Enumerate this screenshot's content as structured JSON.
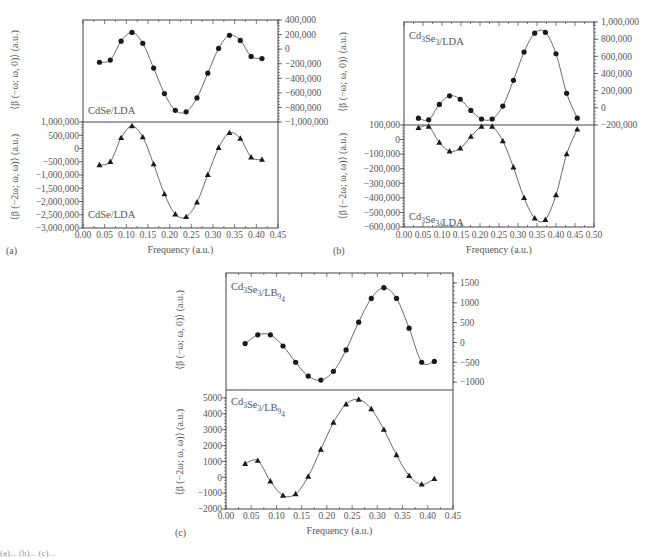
{
  "figure": {
    "caption_fragment": "(a)... (b)... (c)..."
  },
  "chart_data": [
    {
      "panel": "a",
      "subplot": "top",
      "type": "line",
      "label": "CdSe/LDA",
      "ylabel": "⟨β (−ω; ω, 0)⟩ (a.u.)",
      "xlabel": "",
      "y_axis_side": "right",
      "ylim": [
        -1000000,
        400000
      ],
      "yticks": [
        400000,
        200000,
        0,
        -200000,
        -400000,
        -600000,
        -800000,
        -1000000
      ],
      "ytick_labels": [
        "400,000",
        "200,000",
        "0",
        "−200,000",
        "−400,000",
        "−600,000",
        "−800,000",
        "−1,000,000"
      ],
      "xlim": [
        0.0,
        0.45
      ],
      "marker": "circle",
      "x": [
        0.038,
        0.063,
        0.088,
        0.113,
        0.138,
        0.163,
        0.188,
        0.213,
        0.238,
        0.263,
        0.288,
        0.313,
        0.338,
        0.363,
        0.388,
        0.413
      ],
      "values": [
        -180000,
        -150000,
        110000,
        230000,
        80000,
        -260000,
        -610000,
        -840000,
        -860000,
        -670000,
        -330000,
        10000,
        190000,
        120000,
        -100000,
        -130000
      ]
    },
    {
      "panel": "a",
      "subplot": "bottom",
      "type": "line",
      "label": "CdSe/LDA",
      "ylabel": "⟨β (−2ω; ω, ω)⟩ (a.u.)",
      "xlabel": "Frequency (a.u.)",
      "y_axis_side": "left",
      "ylim": [
        -3000000,
        1000000
      ],
      "yticks": [
        1000000,
        500000,
        0,
        -500000,
        -1000000,
        -1500000,
        -2000000,
        -2500000,
        -3000000
      ],
      "ytick_labels": [
        "1,000,000",
        "500,000",
        "0",
        "−500,000",
        "−1,000,000",
        "−1,500,000",
        "−2,000,000",
        "−2,500,000",
        "−3,000,000"
      ],
      "xlim": [
        0.0,
        0.45
      ],
      "xticks": [
        0.0,
        0.05,
        0.1,
        0.15,
        0.2,
        0.25,
        0.3,
        0.35,
        0.4,
        0.45
      ],
      "xtick_labels": [
        "0.00",
        "0.05",
        "0.10",
        "0.15",
        "0.20",
        "0.25",
        "0.30",
        "0.35",
        "0.40",
        "0.45"
      ],
      "marker": "triangle",
      "x": [
        0.038,
        0.063,
        0.088,
        0.113,
        0.138,
        0.163,
        0.188,
        0.213,
        0.238,
        0.263,
        0.288,
        0.313,
        0.338,
        0.363,
        0.388,
        0.413
      ],
      "values": [
        -620000,
        -500000,
        400000,
        850000,
        430000,
        -590000,
        -1720000,
        -2480000,
        -2580000,
        -2030000,
        -990000,
        30000,
        590000,
        380000,
        -330000,
        -420000
      ]
    },
    {
      "panel": "b",
      "subplot": "top",
      "type": "line",
      "label": "Cd3Se3/LDA",
      "ylabel": "⟨β (−ω; ω, 0)⟩ (a.u.)",
      "xlabel": "",
      "y_axis_side": "right",
      "ylim": [
        -200000,
        1000000
      ],
      "yticks": [
        1000000,
        800000,
        600000,
        400000,
        200000,
        0,
        -200000
      ],
      "ytick_labels": [
        "1,000,000",
        "800,000",
        "600,000",
        "400,000",
        "200,000",
        "0",
        "−200,000"
      ],
      "xlim": [
        0.0,
        0.5
      ],
      "marker": "circle",
      "x": [
        0.038,
        0.065,
        0.093,
        0.12,
        0.148,
        0.176,
        0.204,
        0.232,
        0.26,
        0.288,
        0.316,
        0.344,
        0.372,
        0.4,
        0.428,
        0.456
      ],
      "values": [
        -120000,
        -140000,
        40000,
        140000,
        100000,
        -30000,
        -130000,
        -130000,
        20000,
        320000,
        650000,
        870000,
        880000,
        630000,
        170000,
        -120000
      ]
    },
    {
      "panel": "b",
      "subplot": "bottom",
      "type": "line",
      "label": "Cd3Se3/LDA",
      "ylabel": "⟨β (−2ω; ω, ω)⟩ (a.u.)",
      "xlabel": "Frequency (a.u.)",
      "y_axis_side": "left",
      "ylim": [
        -600000,
        100000
      ],
      "yticks": [
        100000,
        0,
        -100000,
        -200000,
        -300000,
        -400000,
        -500000,
        -600000
      ],
      "ytick_labels": [
        "100,000",
        "0",
        "−100,000",
        "−200,000",
        "−300,000",
        "−400,000",
        "−500,000",
        "−600,000"
      ],
      "xlim": [
        0.0,
        0.5
      ],
      "xticks": [
        0.0,
        0.05,
        0.1,
        0.15,
        0.2,
        0.25,
        0.3,
        0.35,
        0.4,
        0.45,
        0.5
      ],
      "xtick_labels": [
        "0.00",
        "0.05",
        "0.10",
        "0.15",
        "0.20",
        "0.25",
        "0.30",
        "0.35",
        "0.40",
        "0.45",
        "0.50"
      ],
      "marker": "triangle",
      "x": [
        0.038,
        0.065,
        0.093,
        0.12,
        0.148,
        0.176,
        0.204,
        0.232,
        0.26,
        0.288,
        0.316,
        0.344,
        0.372,
        0.4,
        0.428,
        0.456
      ],
      "values": [
        80000,
        90000,
        -20000,
        -80000,
        -60000,
        20000,
        90000,
        90000,
        -10000,
        -190000,
        -400000,
        -540000,
        -550000,
        -380000,
        -100000,
        70000
      ]
    },
    {
      "panel": "c",
      "subplot": "top",
      "type": "line",
      "label": "Cd3Se3/LB94",
      "ylabel": "⟨β (−ω; ω, 0)⟩ (a.u.)",
      "xlabel": "",
      "y_axis_side": "right",
      "ylim": [
        -1200,
        1750
      ],
      "yticks": [
        1500,
        1000,
        500,
        0,
        -500,
        -1000
      ],
      "ytick_labels": [
        "1500",
        "1000",
        "500",
        "0",
        "−500",
        "−1000"
      ],
      "xlim": [
        0.0,
        0.45
      ],
      "marker": "circle",
      "x": [
        0.038,
        0.063,
        0.088,
        0.113,
        0.138,
        0.163,
        0.188,
        0.213,
        0.238,
        0.263,
        0.288,
        0.313,
        0.338,
        0.363,
        0.388,
        0.413
      ],
      "values": [
        -30,
        190,
        190,
        -90,
        -500,
        -850,
        -950,
        -730,
        -190,
        510,
        1110,
        1380,
        1110,
        360,
        -500,
        -480
      ]
    },
    {
      "panel": "c",
      "subplot": "bottom",
      "type": "line",
      "label": "Cd3Se3/LB94",
      "ylabel": "⟨β (−2ω; ω, ω)⟩ (a.u.)",
      "xlabel": "Frequency (a.u.)",
      "y_axis_side": "left",
      "ylim": [
        -2000,
        5500
      ],
      "yticks": [
        5000,
        4000,
        3000,
        2000,
        1000,
        0,
        -1000,
        -2000
      ],
      "ytick_labels": [
        "5000",
        "4000",
        "3000",
        "2000",
        "1000",
        "0",
        "−1000",
        "−2000"
      ],
      "xlim": [
        0.0,
        0.45
      ],
      "xticks": [
        0.0,
        0.05,
        0.1,
        0.15,
        0.2,
        0.25,
        0.3,
        0.35,
        0.4,
        0.45
      ],
      "xtick_labels": [
        "0.00",
        "0.05",
        "0.10",
        "0.15",
        "0.20",
        "0.25",
        "0.30",
        "0.35",
        "0.40",
        "0.45"
      ],
      "marker": "triangle",
      "x": [
        0.038,
        0.063,
        0.088,
        0.113,
        0.138,
        0.163,
        0.188,
        0.213,
        0.238,
        0.263,
        0.288,
        0.313,
        0.338,
        0.363,
        0.388,
        0.413
      ],
      "values": [
        850,
        1050,
        -250,
        -1150,
        -1050,
        50,
        1750,
        3450,
        4600,
        4900,
        4300,
        3000,
        1400,
        100,
        -450,
        -100
      ]
    }
  ],
  "panels": [
    {
      "tag": "(a)",
      "xlabel": "Frequency (a.u.)",
      "top_ylabel": "⟨β (−ω; ω, 0)⟩ (a.u.)",
      "bottom_ylabel": "⟨β (−2ω; ω, ω)⟩ (a.u.)",
      "top_label": "CdSe/LDA",
      "bottom_label": "CdSe/LDA"
    },
    {
      "tag": "(b)",
      "xlabel": "Frequency (a.u.)",
      "top_ylabel": "⟨β (−ω; ω, 0)⟩ (a.u.)",
      "bottom_ylabel": "⟨β (−2ω; ω, ω)⟩ (a.u.)",
      "top_label": "Cd3Se3/LDA",
      "bottom_label": "Cd3Se3/LDA"
    },
    {
      "tag": "(c)",
      "xlabel": "Frequency (a.u.)",
      "top_ylabel": "⟨β (−ω; ω, 0)⟩ (a.u.)",
      "bottom_ylabel": "⟨β (−2ω; ω, ω)⟩ (a.u.)",
      "top_label": "Cd3Se3/LB94",
      "bottom_label": "Cd3Se3/LB94"
    }
  ],
  "style": {
    "line_color": "#6a6a6a",
    "marker_color": "#1a1a1a",
    "axis_color": "#444444",
    "text_color": "#555555"
  }
}
